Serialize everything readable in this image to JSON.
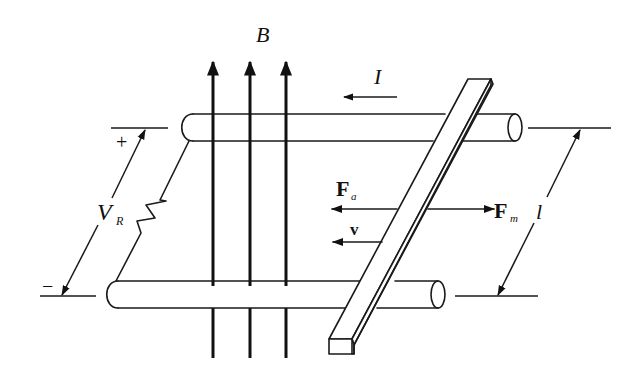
{
  "diagram": {
    "labels": {
      "field": "B",
      "current": "I",
      "voltage_main": "V",
      "voltage_sub": "R",
      "plus": "+",
      "minus": "−",
      "force_applied_main": "F",
      "force_applied_sub": "a",
      "force_magnetic_main": "F",
      "force_magnetic_sub": "m",
      "velocity": "v",
      "length": "l"
    },
    "arrows": {
      "field_lines": 3,
      "field_direction": "up",
      "current_direction": "left",
      "applied_force_direction": "left",
      "magnetic_force_direction": "right",
      "velocity_direction": "left"
    },
    "colors": {
      "ink": "#1a1a1a",
      "background": "#ffffff"
    }
  }
}
